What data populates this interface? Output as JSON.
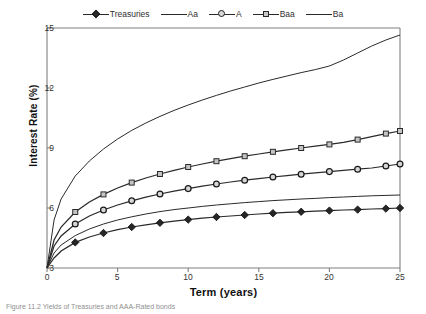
{
  "chart_data": {
    "type": "line",
    "title": "",
    "xlabel": "Term (years)",
    "ylabel": "Interest Rate (%)",
    "xlim": [
      0,
      25
    ],
    "ylim": [
      3,
      15
    ],
    "xticks": [
      0,
      5,
      10,
      15,
      20,
      25
    ],
    "yticks": [
      3,
      6,
      9,
      12,
      15
    ],
    "grid": false,
    "legend_position": "top-center",
    "x": [
      0,
      0.5,
      1,
      2,
      3,
      4,
      5,
      6,
      7,
      8,
      9,
      10,
      11,
      12,
      13,
      14,
      15,
      16,
      17,
      18,
      19,
      20,
      21,
      22,
      23,
      24,
      25
    ],
    "series": [
      {
        "name": "Treasuries",
        "marker": "diamond",
        "values": [
          3.0,
          3.5,
          3.85,
          4.28,
          4.55,
          4.75,
          4.92,
          5.05,
          5.16,
          5.26,
          5.34,
          5.42,
          5.49,
          5.55,
          5.6,
          5.65,
          5.7,
          5.74,
          5.78,
          5.81,
          5.84,
          5.87,
          5.9,
          5.92,
          5.95,
          5.97,
          6.0
        ]
      },
      {
        "name": "Aa",
        "marker": "none",
        "values": [
          3.0,
          3.75,
          4.15,
          4.62,
          4.95,
          5.2,
          5.4,
          5.56,
          5.7,
          5.82,
          5.92,
          6.0,
          6.08,
          6.15,
          6.21,
          6.27,
          6.32,
          6.37,
          6.41,
          6.45,
          6.48,
          6.52,
          6.55,
          6.58,
          6.61,
          6.63,
          6.65
        ]
      },
      {
        "name": "A",
        "marker": "circle",
        "values": [
          3.0,
          4.1,
          4.6,
          5.2,
          5.6,
          5.9,
          6.15,
          6.36,
          6.54,
          6.7,
          6.84,
          6.97,
          7.09,
          7.2,
          7.3,
          7.39,
          7.47,
          7.55,
          7.62,
          7.69,
          7.76,
          7.82,
          7.88,
          7.94,
          8.0,
          8.1,
          8.2
        ]
      },
      {
        "name": "Baa",
        "marker": "square",
        "values": [
          3.0,
          4.4,
          5.05,
          5.8,
          6.3,
          6.68,
          7.0,
          7.27,
          7.5,
          7.7,
          7.88,
          8.05,
          8.2,
          8.34,
          8.47,
          8.59,
          8.7,
          8.81,
          8.91,
          9.0,
          9.09,
          9.18,
          9.28,
          9.42,
          9.57,
          9.72,
          9.85
        ]
      },
      {
        "name": "Ba",
        "marker": "none",
        "values": [
          3.0,
          5.4,
          6.45,
          7.6,
          8.35,
          8.95,
          9.45,
          9.88,
          10.25,
          10.58,
          10.88,
          11.15,
          11.4,
          11.63,
          11.85,
          12.05,
          12.25,
          12.43,
          12.6,
          12.77,
          12.92,
          13.1,
          13.4,
          13.75,
          14.1,
          14.4,
          14.65
        ]
      }
    ]
  },
  "legend": [
    {
      "label": "Treasuries",
      "marker": "diamond"
    },
    {
      "label": "Aa",
      "marker": "none"
    },
    {
      "label": "A",
      "marker": "circle"
    },
    {
      "label": "Baa",
      "marker": "square"
    },
    {
      "label": "Ba",
      "marker": "none"
    }
  ],
  "axes": {
    "ylabel": "Interest Rate (%)",
    "xlabel": "Term (years)",
    "yticks": [
      "15",
      "12",
      "9",
      "6",
      "3"
    ],
    "xticks": [
      "0",
      "5",
      "10",
      "15",
      "20",
      "25"
    ]
  },
  "caption": {
    "text": "Figure 11.2  Yields of Treasuries and AAA-Rated bonds"
  },
  "colors": {
    "line": "#2a2a2a",
    "axis": "#808080",
    "text": "#1a1a1a"
  }
}
